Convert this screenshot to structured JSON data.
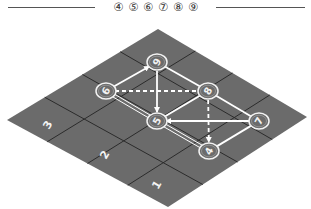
{
  "header": {
    "title": "④ ⑤ ⑥ ⑦ ⑧ ⑨"
  },
  "colors": {
    "board": "#6b6b6b",
    "grid_line": "#2b2b2b",
    "node_stroke": "#f2f2f2",
    "edge": "#ffffff",
    "label": "#f2f2f2"
  },
  "board": {
    "rows": 4,
    "cols": 4,
    "cell_labels": [
      {
        "text": "3",
        "x": 48,
        "y": 125
      },
      {
        "text": "2",
        "x": 105,
        "y": 155
      },
      {
        "text": "1",
        "x": 157,
        "y": 185
      }
    ]
  },
  "nodes": [
    {
      "id": "9",
      "label": "9",
      "x": 157,
      "y": 62
    },
    {
      "id": "6",
      "label": "6",
      "x": 106,
      "y": 91
    },
    {
      "id": "8",
      "label": "8",
      "x": 208,
      "y": 91
    },
    {
      "id": "5",
      "label": "5",
      "x": 157,
      "y": 121
    },
    {
      "id": "7",
      "label": "7",
      "x": 259,
      "y": 121
    },
    {
      "id": "4",
      "label": "4",
      "x": 209,
      "y": 151
    }
  ],
  "edges": [
    {
      "from": "6",
      "to": "9",
      "style": "solid",
      "arrow": "end"
    },
    {
      "from": "9",
      "to": "8",
      "style": "solid",
      "arrow": "none"
    },
    {
      "from": "9",
      "to": "5",
      "style": "solid",
      "arrow": "end"
    },
    {
      "from": "6",
      "to": "8",
      "style": "dashed",
      "arrow": "none"
    },
    {
      "from": "6",
      "to": "5",
      "style": "double",
      "arrow": "none"
    },
    {
      "from": "5",
      "to": "4",
      "style": "double",
      "arrow": "none"
    },
    {
      "from": "5",
      "to": "8",
      "style": "solid",
      "arrow": "none"
    },
    {
      "from": "7",
      "to": "5",
      "style": "solid",
      "arrow": "end"
    },
    {
      "from": "8",
      "to": "4",
      "style": "dashed",
      "arrow": "end"
    },
    {
      "from": "8",
      "to": "7",
      "style": "solid",
      "arrow": "none"
    },
    {
      "from": "4",
      "to": "7",
      "style": "solid",
      "arrow": "none"
    }
  ]
}
